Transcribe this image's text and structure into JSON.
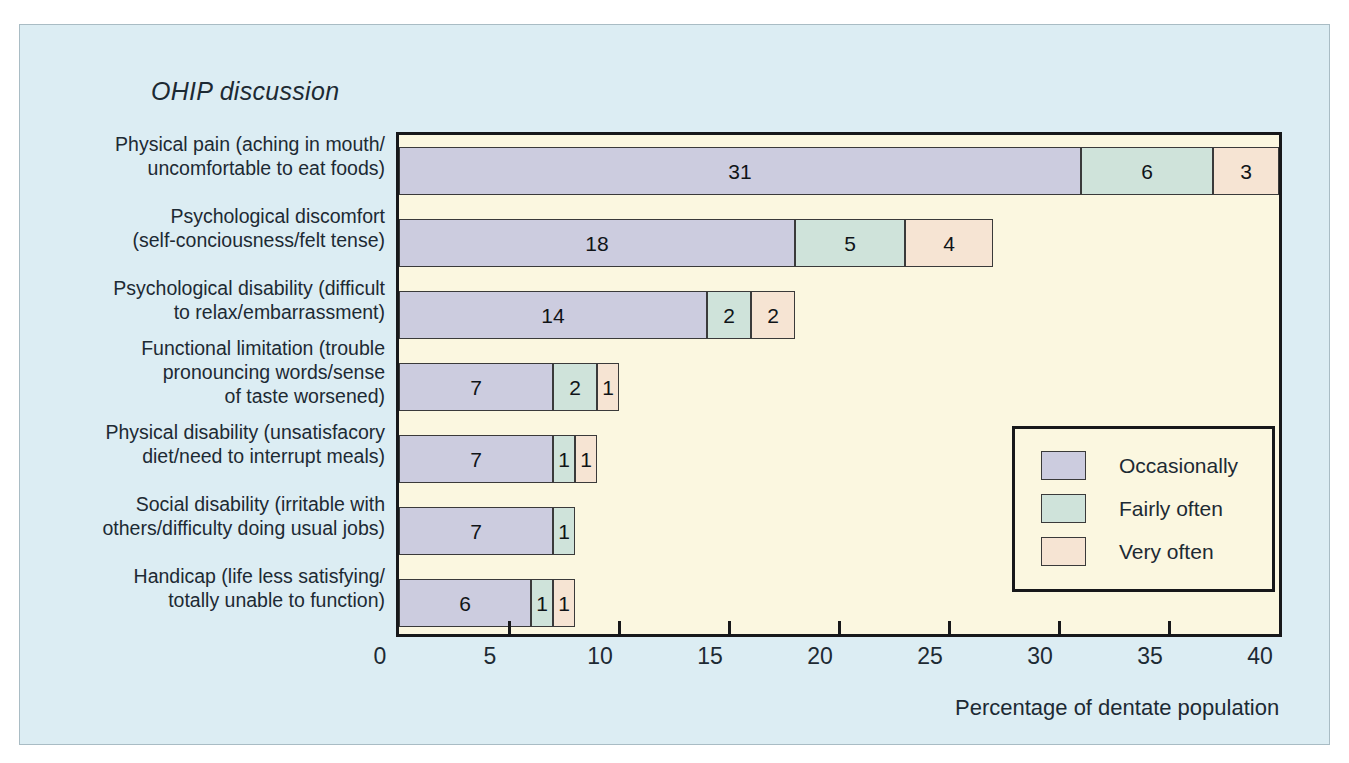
{
  "figure": {
    "title": "OHIP discussion",
    "panel_background": "#dcedf3",
    "plot_background": "#fbf7e0"
  },
  "chart_data": {
    "type": "bar",
    "orientation": "horizontal",
    "stacked": true,
    "title": "OHIP discussion",
    "xlabel": "Percentage of dentate population",
    "ylabel": "",
    "xlim": [
      0,
      40
    ],
    "xticks": [
      0,
      5,
      10,
      15,
      20,
      25,
      30,
      35,
      40
    ],
    "xtick_labels": [
      "0",
      "5",
      "10",
      "15",
      "20",
      "25",
      "30",
      "35",
      "40"
    ],
    "grid": false,
    "legend_position": "inside-right",
    "categories": [
      "Physical pain (aching in mouth/uncomfortable to eat foods)",
      "Psychological discomfort (self-conciousness/felt tense)",
      "Psychological disability (difficult to relax/embarrassment)",
      "Functional limitation (trouble pronouncing words/sense of taste worsened)",
      "Physical disability (unsatisfacory diet/need to interrupt meals)",
      "Social disability (irritable with others/difficulty doing usual jobs)",
      "Handicap (life less satisfying/totally unable to function)"
    ],
    "category_lines": [
      [
        "Physical pain (aching in mouth/",
        "uncomfortable to eat foods)"
      ],
      [
        "Psychological discomfort",
        "(self-conciousness/felt tense)"
      ],
      [
        "Psychological disability (difficult",
        "to relax/embarrassment)"
      ],
      [
        "Functional limitation (trouble",
        "pronouncing words/sense",
        "of taste worsened)"
      ],
      [
        "Physical disability (unsatisfacory",
        "diet/need to interrupt meals)"
      ],
      [
        "Social disability (irritable with",
        "others/difficulty doing usual jobs)"
      ],
      [
        "Handicap (life less satisfying/",
        "totally unable to function)"
      ]
    ],
    "series": [
      {
        "name": "Occasionally",
        "color": "#ccccdf",
        "values": [
          31,
          18,
          14,
          7,
          7,
          7,
          6
        ]
      },
      {
        "name": "Fairly often",
        "color": "#cfe3da",
        "values": [
          6,
          5,
          2,
          2,
          1,
          1,
          1
        ]
      },
      {
        "name": "Very often",
        "color": "#f6e4d3",
        "values": [
          3,
          4,
          2,
          1,
          1,
          0,
          1
        ]
      }
    ],
    "bar_labels": [
      [
        "31",
        "6",
        "3"
      ],
      [
        "18",
        "5",
        "4"
      ],
      [
        "14",
        "2",
        "2"
      ],
      [
        "7",
        "2",
        "1"
      ],
      [
        "7",
        "1",
        "1"
      ],
      [
        "7",
        "1",
        ""
      ],
      [
        "6",
        "1",
        "1"
      ]
    ]
  },
  "legend": {
    "items": [
      {
        "label": "Occasionally",
        "color": "#ccccdf"
      },
      {
        "label": "Fairly often",
        "color": "#cfe3da"
      },
      {
        "label": "Very often",
        "color": "#f6e4d3"
      }
    ]
  }
}
